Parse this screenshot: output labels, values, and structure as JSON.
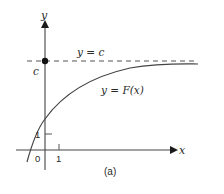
{
  "figure": {
    "caption": "(a)",
    "axes": {
      "x_label": "x",
      "y_label": "y",
      "origin_label": "0",
      "x_tick_label": "1",
      "y_tick_label": "1"
    },
    "asymptote": {
      "label": "y = c",
      "value_label": "c",
      "style": "dashed"
    },
    "curve": {
      "label": "y = F(x)",
      "description": "increasing concave curve approaching horizontal asymptote y = c"
    },
    "colors": {
      "ink": "#2a2a2a",
      "background": "#ffffff"
    }
  }
}
